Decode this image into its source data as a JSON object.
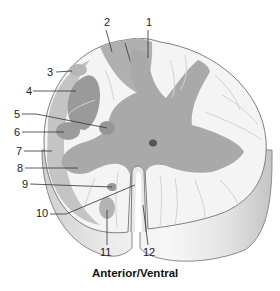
{
  "diagram": {
    "caption": "Anterior/Ventral",
    "labels": [
      {
        "id": "1",
        "text": "1",
        "x": 150,
        "y": 26
      },
      {
        "id": "2",
        "text": "2",
        "x": 104,
        "y": 26
      },
      {
        "id": "3",
        "text": "3",
        "x": 47,
        "y": 76
      },
      {
        "id": "4",
        "text": "4",
        "x": 26,
        "y": 95
      },
      {
        "id": "5",
        "text": "5",
        "x": 14,
        "y": 118
      },
      {
        "id": "6",
        "text": "6",
        "x": 14,
        "y": 136
      },
      {
        "id": "7",
        "text": "7",
        "x": 16,
        "y": 155
      },
      {
        "id": "8",
        "text": "8",
        "x": 17,
        "y": 172
      },
      {
        "id": "9",
        "text": "9",
        "x": 22,
        "y": 188
      },
      {
        "id": "10",
        "text": "10",
        "x": 36,
        "y": 217
      },
      {
        "id": "11",
        "text": "11",
        "x": 100,
        "y": 256
      },
      {
        "id": "12",
        "text": "12",
        "x": 145,
        "y": 256
      }
    ],
    "colors": {
      "white_matter": "#f4f4f4",
      "gray_matter": "#a9a9a9",
      "tract_shade": "#b8b8b8",
      "nucleus": "#9a9a9a",
      "outline": "#808080",
      "side_wall": "#e2e2e2",
      "side_wall_dark": "#c8c8c8",
      "canal": "#555555"
    }
  }
}
